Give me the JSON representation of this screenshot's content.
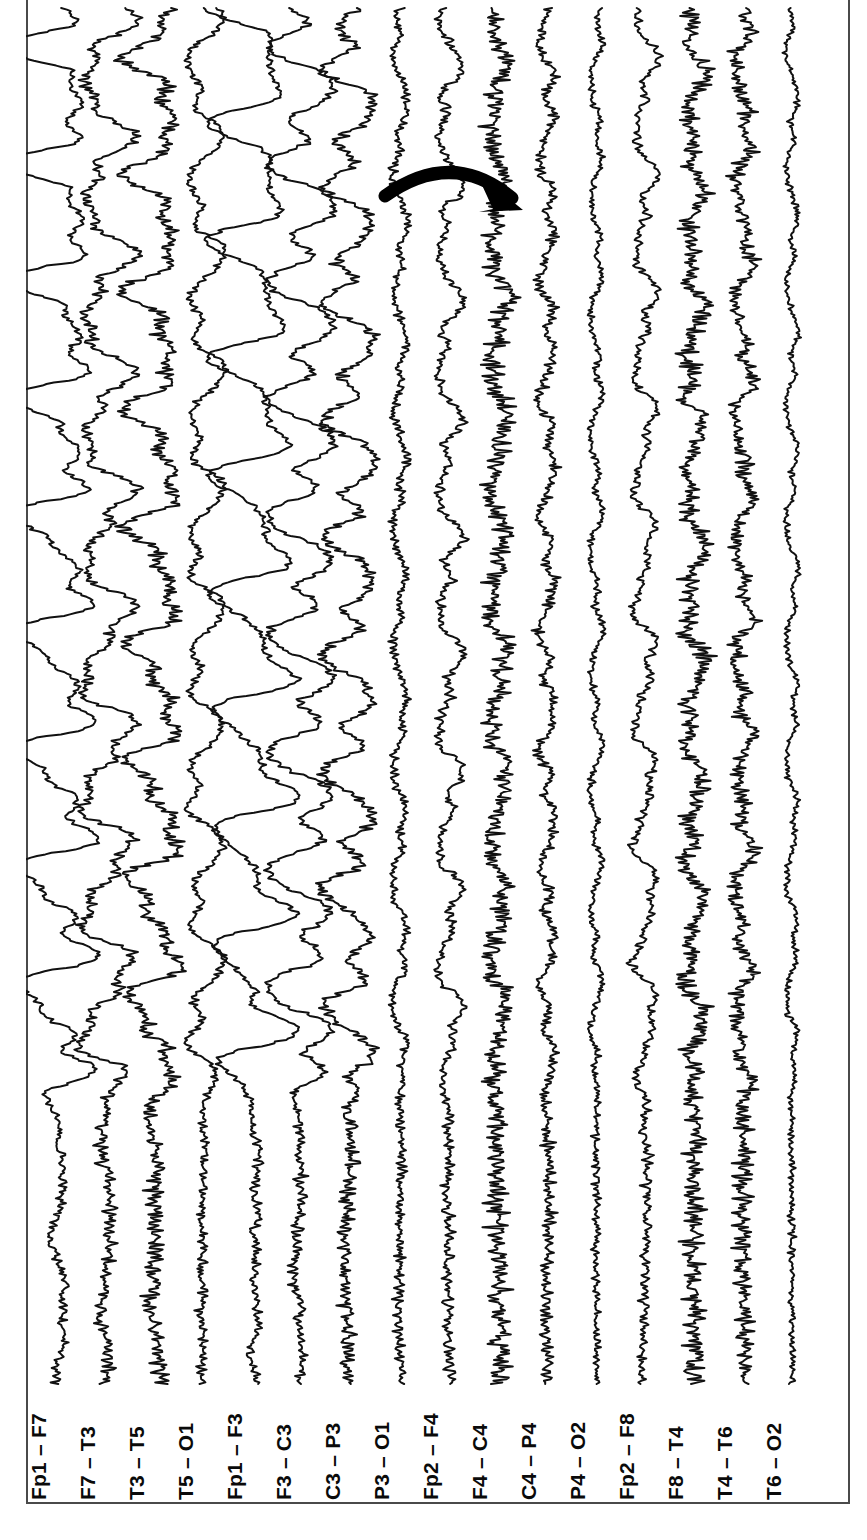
{
  "figure": {
    "kind": "eeg-recording",
    "background_color": "#ffffff",
    "trace_color": "#111111",
    "frame_color": "#4a4a4a",
    "orientation": "channels-vertical-labels-rotated",
    "label_rotation_deg": -90
  },
  "annotation": {
    "type": "curved-arrow",
    "color": "#000000",
    "start_x": 385,
    "start_y": 196,
    "ctrl_x": 452,
    "ctrl_y": 148,
    "end_x": 512,
    "end_y": 198,
    "tip_x": 523,
    "tip_y": 210,
    "description": "curved arrow pointing toward right hemisphere fast activity"
  },
  "channels": [
    {
      "label": "Fp1 – F7",
      "x": 57,
      "amp": 34,
      "slow_amp": 46,
      "freq": 1.05,
      "fast_amp": 5.0,
      "fast_freq": 17,
      "seed": 11
    },
    {
      "label": "F7 – T3",
      "x": 106,
      "amp": 24,
      "slow_amp": 34,
      "freq": 1.05,
      "fast_amp": 8.0,
      "fast_freq": 21,
      "seed": 23
    },
    {
      "label": "T3 – T5",
      "x": 155,
      "amp": 22,
      "slow_amp": 30,
      "freq": 1.05,
      "fast_amp": 11.0,
      "fast_freq": 26,
      "seed": 37
    },
    {
      "label": "T5 – O1",
      "x": 204,
      "amp": 16,
      "slow_amp": 22,
      "freq": 1.05,
      "fast_amp": 5.5,
      "fast_freq": 22,
      "seed": 41
    },
    {
      "label": "Fp1 – F3",
      "x": 253,
      "amp": 34,
      "slow_amp": 48,
      "freq": 1.05,
      "fast_amp": 5.0,
      "fast_freq": 16,
      "seed": 59
    },
    {
      "label": "F3 – C3",
      "x": 302,
      "amp": 28,
      "slow_amp": 38,
      "freq": 1.05,
      "fast_amp": 6.5,
      "fast_freq": 19,
      "seed": 67
    },
    {
      "label": "C3 – P3",
      "x": 351,
      "amp": 22,
      "slow_amp": 28,
      "freq": 1.05,
      "fast_amp": 9.0,
      "fast_freq": 24,
      "seed": 73
    },
    {
      "label": "P3 – O1",
      "x": 400,
      "amp": 9,
      "slow_amp": 9,
      "freq": 1.05,
      "fast_amp": 6.0,
      "fast_freq": 23,
      "seed": 83
    },
    {
      "label": "Fp2 – F4",
      "x": 449,
      "amp": 14,
      "slow_amp": 15,
      "freq": 1.05,
      "fast_amp": 6.5,
      "fast_freq": 15,
      "seed": 97
    },
    {
      "label": "F4 – C4",
      "x": 498,
      "amp": 11,
      "slow_amp": 11,
      "freq": 1.05,
      "fast_amp": 14.0,
      "fast_freq": 31,
      "seed": 103
    },
    {
      "label": "C4 – P4",
      "x": 547,
      "amp": 9,
      "slow_amp": 9,
      "freq": 1.05,
      "fast_amp": 7.5,
      "fast_freq": 25,
      "seed": 109
    },
    {
      "label": "P4 – O2",
      "x": 596,
      "amp": 7,
      "slow_amp": 7,
      "freq": 1.05,
      "fast_amp": 4.5,
      "fast_freq": 21,
      "seed": 127
    },
    {
      "label": "Fp2 – F8",
      "x": 645,
      "amp": 13,
      "slow_amp": 14,
      "freq": 1.05,
      "fast_amp": 6.0,
      "fast_freq": 14,
      "seed": 131
    },
    {
      "label": "F8 – T4",
      "x": 694,
      "amp": 11,
      "slow_amp": 11,
      "freq": 1.05,
      "fast_amp": 13.5,
      "fast_freq": 30,
      "seed": 149
    },
    {
      "label": "T4 – T6",
      "x": 743,
      "amp": 10,
      "slow_amp": 10,
      "freq": 1.05,
      "fast_amp": 11.0,
      "fast_freq": 28,
      "seed": 157
    },
    {
      "label": "T6 – O2",
      "x": 792,
      "amp": 7,
      "slow_amp": 7,
      "freq": 1.05,
      "fast_amp": 4.0,
      "fast_freq": 20,
      "seed": 167
    }
  ],
  "trace_geometry": {
    "top": 8,
    "bottom": 1384,
    "slow_region_start": 1125,
    "slow_region_note": "large delta waves occupy upper portion; lower portion is low-amplitude fast activity"
  }
}
